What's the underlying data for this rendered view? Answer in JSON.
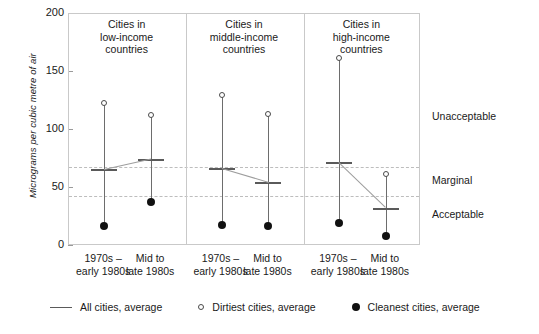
{
  "chart_data": {
    "type": "scatter",
    "title": "",
    "xlabel": "",
    "ylabel": "Micrograms per cubic metre of air",
    "ylim": [
      0,
      200
    ],
    "ytick_values": [
      200,
      150,
      100,
      50,
      0
    ],
    "ytick_labels": [
      "200",
      "150",
      "100",
      "50",
      "0"
    ],
    "grid": false,
    "legend_position": "bottom",
    "panels": [
      {
        "title_line1": "Cities in",
        "title_line2": "low-income",
        "title_line3": "countries",
        "periods": [
          {
            "label_line1": "1970s –",
            "label_line2": "early 1980s",
            "dirtiest": 123,
            "average": 66,
            "cleanest": 17
          },
          {
            "label_line1": "Mid to",
            "label_line2": "late 1980s",
            "dirtiest": 113,
            "average": 75,
            "cleanest": 38
          }
        ]
      },
      {
        "title_line1": "Cities in",
        "title_line2": "middle-income",
        "title_line3": "countries",
        "periods": [
          {
            "label_line1": "1970s –",
            "label_line2": "early 1980s",
            "dirtiest": 130,
            "average": 67,
            "cleanest": 18
          },
          {
            "label_line1": "Mid to",
            "label_line2": "late 1980s",
            "dirtiest": 114,
            "average": 55,
            "cleanest": 17
          }
        ]
      },
      {
        "title_line1": "Cities in",
        "title_line2": "high-income",
        "title_line3": "countries",
        "periods": [
          {
            "label_line1": "1970s –",
            "label_line2": "early 1980s",
            "dirtiest": 162,
            "average": 72,
            "cleanest": 20
          },
          {
            "label_line1": "Mid to",
            "label_line2": "late 1980s",
            "dirtiest": 62,
            "average": 33,
            "cleanest": 9
          }
        ]
      }
    ],
    "reference_lines": [
      {
        "name": "unacceptable-marginal-boundary",
        "value": 68
      },
      {
        "name": "marginal-acceptable-boundary",
        "value": 43
      }
    ],
    "band_labels": [
      {
        "name": "unacceptable",
        "text": "Unacceptable",
        "value": 110
      },
      {
        "name": "marginal",
        "text": "Marginal",
        "value": 55
      },
      {
        "name": "acceptable",
        "text": "Acceptable",
        "value": 26
      }
    ],
    "legend": [
      {
        "marker": "line",
        "label": "All cities, average"
      },
      {
        "marker": "open-circle",
        "label": "Dirtiest cities, average"
      },
      {
        "marker": "filled-circle",
        "label": "Cleanest cities, average"
      }
    ],
    "colors": {
      "stem": "#6d6d6d",
      "average_tick": "#5a5a5a",
      "dirtiest_marker": "#4a4a4a",
      "cleanest_marker": "#111111",
      "reference_line": "#bdbdbd",
      "frame": "#c9c9c9",
      "text": "#1a1a1a",
      "background": "#ffffff"
    }
  }
}
